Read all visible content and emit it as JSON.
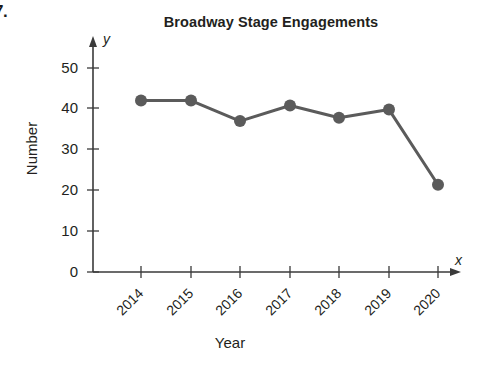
{
  "problem": {
    "number": "7."
  },
  "chart_data": {
    "type": "line",
    "title": "Broadway Stage Engagements",
    "xlabel": "Year",
    "ylabel": "Number",
    "x_axis_variable": "x",
    "y_axis_variable": "y",
    "categories": [
      "2014",
      "2015",
      "2016",
      "2017",
      "2018",
      "2019",
      "2020"
    ],
    "values": [
      41.8,
      41.8,
      36.8,
      40.6,
      37.6,
      39.6,
      21.3
    ],
    "ytick_labels": [
      "0",
      "10",
      "20",
      "30",
      "40",
      "50"
    ],
    "ytick_values": [
      0,
      10,
      20,
      30,
      40,
      50
    ],
    "ylim": [
      0,
      55
    ],
    "grid": false,
    "legend": null,
    "series_color": "#5b5b5b",
    "axis_color": "#3a3a3a",
    "marker": "circle",
    "xtick_label_rotation": -45
  }
}
